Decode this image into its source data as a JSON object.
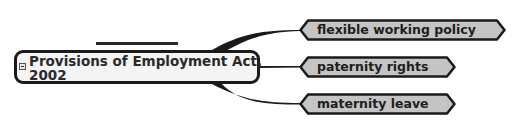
{
  "diagram": {
    "type": "mind-map",
    "central_topic": {
      "label": "Provisions of Employment Act,\n2002",
      "collapse_icon": "minus-box-icon"
    },
    "branches": [
      {
        "label": "flexible working policy"
      },
      {
        "label": "paternity rights"
      },
      {
        "label": "maternity leave"
      }
    ],
    "colors": {
      "central_fill": "#f4f4f4",
      "child_fill": "#c4c4c4",
      "border": "#1a1a1a",
      "connector": "#1a1a1a",
      "background": "#ffffff"
    }
  }
}
